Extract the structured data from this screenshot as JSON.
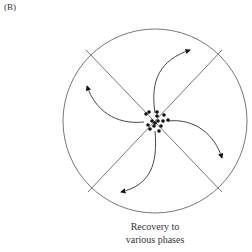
{
  "panel_label": "(B)",
  "caption": {
    "line1": "Recovery to",
    "line2": "various phases"
  },
  "colors": {
    "stroke": "#555555",
    "dots": "#111111"
  },
  "diagram": {
    "circle": {
      "cx": 155,
      "cy": 121,
      "r": 92
    },
    "axes": 2,
    "arrows": 4,
    "central_dot_cluster": true
  }
}
